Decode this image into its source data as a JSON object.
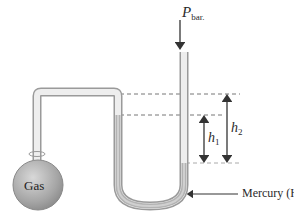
{
  "diagram": {
    "labels": {
      "pressure_symbol": "P",
      "pressure_subscript": "bar.",
      "h1_symbol": "h",
      "h1_subscript": "1",
      "h2_symbol": "h",
      "h2_subscript": "2",
      "mercury": "Mercury (Hg)",
      "gas": "Gas"
    },
    "colors": {
      "glass": "#d4d4d4",
      "glass_edge": "#9a9a9a",
      "mercury": "#b0b0b0",
      "flask": "#a8a8a8",
      "arrow": "#333333",
      "dashed": "#777777"
    }
  }
}
